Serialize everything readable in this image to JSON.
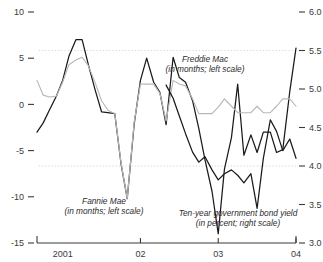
{
  "chart_data": {
    "type": "line",
    "title": "",
    "subtitle": "",
    "xlabel": "",
    "ylabel": "",
    "grid": "horizontal-dotted",
    "legend_position": "inline-annotations",
    "axes": {
      "left": {
        "label": "in months",
        "ticks": [
          "10",
          "5",
          "0",
          "-5",
          "-10",
          "-15"
        ],
        "tick_values": [
          10,
          5,
          0,
          -5,
          -10,
          -15
        ],
        "ylim": [
          -15,
          10
        ]
      },
      "right": {
        "label": "in percent",
        "ticks": [
          "6.0",
          "5.5",
          "5.0",
          "4.5",
          "4.0",
          "3.5",
          "3.0"
        ],
        "tick_values": [
          6.0,
          5.5,
          5.0,
          4.5,
          4.0,
          3.5,
          3.0
        ],
        "ylim": [
          3.0,
          6.0
        ]
      },
      "bottom": {
        "ticks": [
          "2001",
          "02",
          "03",
          "04"
        ],
        "tick_positions": [
          0,
          1,
          2,
          3
        ],
        "xlim": [
          -0.33,
          3.0
        ]
      }
    },
    "gridlines_right": [
      5.5,
      4.0
    ],
    "series": [
      {
        "name": "Fannie Mae",
        "annotation": "Fannie Mae",
        "annotation_sub": "(in months; left scale)",
        "scale": "left",
        "units": "months",
        "color": "#1a1a1a",
        "x": [
          -0.33,
          -0.25,
          -0.17,
          -0.08,
          0.0,
          0.08,
          0.17,
          0.25,
          0.33,
          0.42,
          0.5,
          0.58,
          0.67,
          0.75,
          0.83,
          0.92,
          1.0,
          1.08,
          1.17,
          1.25,
          1.33,
          1.42,
          1.5,
          1.58,
          1.67,
          1.75,
          1.83,
          1.92,
          2.0,
          2.08,
          2.17,
          2.25,
          2.33,
          2.42,
          2.5,
          2.58,
          2.67,
          2.75,
          2.83,
          2.92,
          3.0
        ],
        "values": [
          -3.0,
          -2.0,
          -0.6,
          0.9,
          2.6,
          5.2,
          7.0,
          7.0,
          4.3,
          1.5,
          -0.8,
          -0.9,
          -1.0,
          -6.4,
          -10.2,
          -2.1,
          2.6,
          5.0,
          2.4,
          1.3,
          -2.2,
          5.1,
          2.9,
          2.4,
          0.4,
          -2.6,
          -6.0,
          -9.4,
          -14.0,
          -7.0,
          -3.6,
          2.2,
          -5.5,
          -3.3,
          -5.2,
          -3.0,
          -3.0,
          -5.2,
          -4.9,
          1.4,
          6.1
        ]
      },
      {
        "name": "Freddie Mac",
        "annotation": "Freddie Mac",
        "annotation_sub": "(in months; left scale)",
        "scale": "left",
        "units": "months",
        "color": "#b8b8b8",
        "x": [
          -0.33,
          -0.25,
          -0.17,
          -0.08,
          0.0,
          0.08,
          0.17,
          0.25,
          0.33,
          0.42,
          0.5,
          0.58,
          0.67,
          0.75,
          0.83,
          0.92,
          1.0,
          1.08,
          1.17,
          1.25,
          1.33,
          1.42,
          1.5,
          1.58,
          1.67,
          1.75,
          1.83,
          1.92,
          2.0,
          2.08,
          2.17,
          2.25,
          2.33,
          2.42,
          2.5,
          2.58,
          2.67,
          2.75,
          2.83,
          2.92,
          3.0
        ],
        "values": [
          2.6,
          1.0,
          0.8,
          0.9,
          2.4,
          4.3,
          4.8,
          5.1,
          4.2,
          2.3,
          0.4,
          -0.6,
          -1.0,
          -6.3,
          -10.2,
          -1.9,
          2.2,
          2.2,
          2.2,
          1.2,
          -1.8,
          2.6,
          2.2,
          2.0,
          0.6,
          -1.0,
          -1.0,
          -1.0,
          -0.3,
          0.6,
          -0.2,
          -0.9,
          -0.9,
          -0.9,
          -0.2,
          -0.9,
          -0.9,
          -0.2,
          0.6,
          0.6,
          -0.2
        ]
      },
      {
        "name": "Ten-year government bond yield",
        "annotation": "Ten-year government bond yield",
        "annotation_sub": "(in percent; right scale)",
        "scale": "right",
        "units": "percent",
        "color": "#1a1a1a",
        "x": [
          1.33,
          1.42,
          1.5,
          1.58,
          1.67,
          1.75,
          1.83,
          1.92,
          2.0,
          2.08,
          2.17,
          2.25,
          2.33,
          2.42,
          2.5,
          2.58,
          2.67,
          2.75,
          2.83,
          2.92,
          3.0
        ],
        "values": [
          5.05,
          4.88,
          4.65,
          4.42,
          4.18,
          4.05,
          4.12,
          3.95,
          3.82,
          3.9,
          3.95,
          3.88,
          3.78,
          3.9,
          3.45,
          4.1,
          4.6,
          4.45,
          4.2,
          4.35,
          4.1
        ]
      }
    ]
  }
}
